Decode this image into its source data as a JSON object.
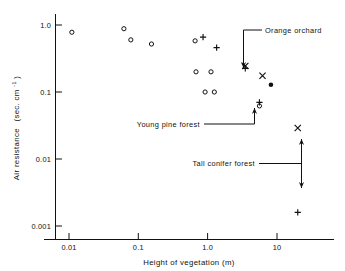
{
  "figure": {
    "name": "air-resistance-vs-vegetation-height"
  },
  "chart_data": {
    "type": "scatter",
    "title": "",
    "xlabel": "Height of vegetation (m)",
    "ylabel_main": "Air resistance",
    "ylabel_units": "(sec. cm",
    "ylabel_units_sup": "-1",
    "ylabel_units_tail": ")",
    "xscale": "log",
    "yscale": "log",
    "xlim": [
      0.004,
      35
    ],
    "ylim": [
      0.0007,
      1.6
    ],
    "grid": false,
    "legend": "none",
    "xticks": [
      0.01,
      0.1,
      1.0,
      10
    ],
    "xticklabels": [
      "0.01",
      "0.1",
      "1.0",
      "10"
    ],
    "yticks": [
      1.0,
      0.1,
      0.01,
      0.001
    ],
    "yticklabels": [
      "1.0",
      "0.1",
      "0.01",
      "0.001"
    ],
    "series": [
      {
        "name": "open-circle",
        "marker": "circle-open",
        "points": [
          {
            "x": 0.011,
            "y": 0.78
          },
          {
            "x": 0.062,
            "y": 0.88
          },
          {
            "x": 0.078,
            "y": 0.6
          },
          {
            "x": 0.155,
            "y": 0.52
          },
          {
            "x": 0.66,
            "y": 0.58
          },
          {
            "x": 0.68,
            "y": 0.2
          },
          {
            "x": 1.12,
            "y": 0.2
          },
          {
            "x": 0.92,
            "y": 0.1
          },
          {
            "x": 1.25,
            "y": 0.1
          },
          {
            "x": 5.6,
            "y": 0.062
          }
        ]
      },
      {
        "name": "plus",
        "marker": "plus",
        "points": [
          {
            "x": 0.86,
            "y": 0.66
          },
          {
            "x": 1.35,
            "y": 0.46
          },
          {
            "x": 3.5,
            "y": 0.225
          },
          {
            "x": 5.6,
            "y": 0.07
          },
          {
            "x": 20.0,
            "y": 0.0016
          }
        ]
      },
      {
        "name": "cross",
        "marker": "cross",
        "points": [
          {
            "x": 3.5,
            "y": 0.245
          },
          {
            "x": 6.2,
            "y": 0.175
          },
          {
            "x": 20.0,
            "y": 0.029
          }
        ]
      },
      {
        "name": "filled-circle",
        "marker": "circle-filled",
        "points": [
          {
            "x": 8.2,
            "y": 0.128
          }
        ]
      }
    ],
    "annotations": [
      {
        "id": "orange-orchard",
        "label": "Orange orchard",
        "points_to": {
          "x": 3.5,
          "y": 0.245
        },
        "arrow": "down"
      },
      {
        "id": "young-pine-forest",
        "label": "Young pine forest",
        "points_to": {
          "x": 5.6,
          "y": 0.062
        },
        "arrow": "up"
      },
      {
        "id": "tall-conifer-forest",
        "label": "Tall conifer forest",
        "points_to": {
          "x": 20.0,
          "y": 0.006
        },
        "arrow": "double"
      }
    ]
  }
}
